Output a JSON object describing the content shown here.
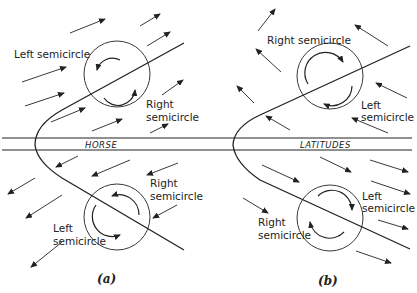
{
  "band": {
    "left_label": "HORSE",
    "right_label": "LATITUDES"
  },
  "panel_a": {
    "caption": "(a)",
    "upper": {
      "left_label": "Left semicircle",
      "right_label_1": "Right",
      "right_label_2": "semicircle"
    },
    "lower": {
      "right_label_1": "Right",
      "right_label_2": "semicircle",
      "left_label_1": "Left",
      "left_label_2": "semicircle"
    }
  },
  "panel_b": {
    "caption": "(b)",
    "upper": {
      "right_label": "Right semicircle",
      "left_label_1": "Left",
      "left_label_2": "semicircle"
    },
    "lower": {
      "left_label_1": "Left",
      "left_label_2": "semicircle",
      "right_label_1": "Right",
      "right_label_2": "semicircle"
    }
  },
  "colors": {
    "ink": "#222222",
    "background": "#ffffff"
  }
}
